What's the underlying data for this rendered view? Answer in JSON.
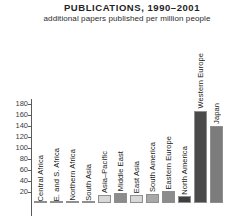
{
  "header": {
    "title": "PUBLICATIONS, 1990–2001",
    "subtitle": "additional papers published per million people"
  },
  "chart_data": {
    "type": "bar",
    "title": "PUBLICATIONS, 1990–2001",
    "subtitle": "additional papers published per million people",
    "xlabel": "",
    "ylabel": "",
    "ylim": [
      0,
      190
    ],
    "grid": false,
    "legend": null,
    "yticks": [
      180,
      160,
      140,
      120,
      100,
      80,
      60,
      40,
      20
    ],
    "categories": [
      "Central Africa",
      "E. and S. Africa",
      "Northern Africa",
      "South Asia",
      "Asia–Pacific",
      "Middle East",
      "East Asia",
      "South America",
      "Eastern Europe",
      "North America",
      "Western Europe",
      "Japan"
    ],
    "values": [
      0,
      0,
      1,
      1,
      14,
      18,
      14,
      16,
      21,
      12,
      168,
      140
    ],
    "colors": [
      "#d8d8d8",
      "#8c8c8c",
      "#d8d8d8",
      "#8c8c8c",
      "#d8d8d8",
      "#8c8c8c",
      "#d8d8d8",
      "#a8a8a8",
      "#8c8c8c",
      "#3f3f3f",
      "#4a4a4a",
      "#7c7c7c"
    ]
  },
  "style": {
    "axis_color": "#5a5a5a",
    "text_color": "#1a1a1a",
    "background": "#ffffff"
  }
}
